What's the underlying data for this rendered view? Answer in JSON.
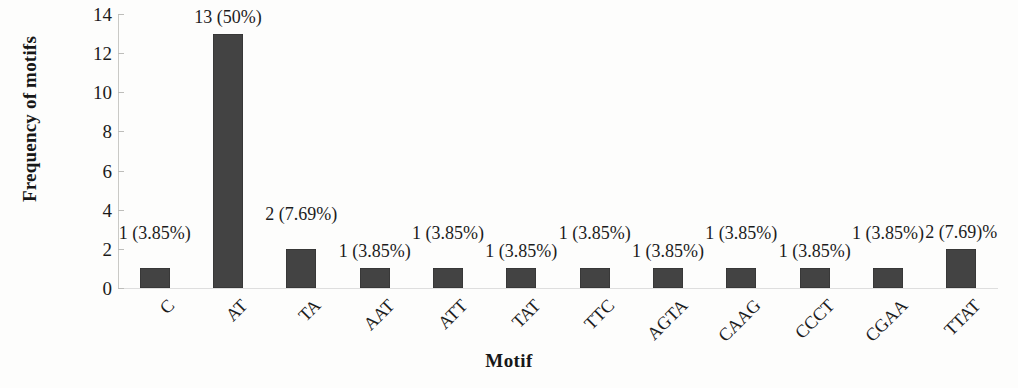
{
  "chart_data": {
    "type": "bar",
    "title": "",
    "xlabel": "Motif",
    "ylabel": "Frequency of motifs",
    "categories": [
      "C",
      "AT",
      "TA",
      "AAT",
      "ATT",
      "TAT",
      "TTC",
      "AGTA",
      "CAAG",
      "CCCT",
      "CGAA",
      "TTAT"
    ],
    "values": [
      1,
      13,
      2,
      1,
      1,
      1,
      1,
      1,
      1,
      1,
      1,
      2
    ],
    "point_labels": [
      "1 (3.85%)",
      "13 (50%)",
      "2 (7.69%)",
      "1 (3.85%)",
      "1 (3.85%)",
      "1 (3.85%)",
      "1 (3.85%)",
      "1 (3.85%)",
      "1 (3.85%)",
      "1 (3.85%)",
      "1 (3.85%)",
      "2 (7.69)%"
    ],
    "percentages": [
      3.85,
      50,
      7.69,
      3.85,
      3.85,
      3.85,
      3.85,
      3.85,
      3.85,
      3.85,
      3.85,
      7.69
    ],
    "ylim": [
      0,
      14
    ],
    "ytick_labels": [
      "14",
      "12",
      "10",
      "8",
      "6",
      "4",
      "2",
      "0"
    ],
    "yticks": [
      14,
      12,
      10,
      8,
      6,
      4,
      2,
      0
    ],
    "ytick_step": 2,
    "grid": false,
    "legend": "none",
    "bar_color": "#434343",
    "background_color": "#fdfdfc",
    "axis_color": "#c9c9c6",
    "xtick_rotation_degrees": 45
  }
}
